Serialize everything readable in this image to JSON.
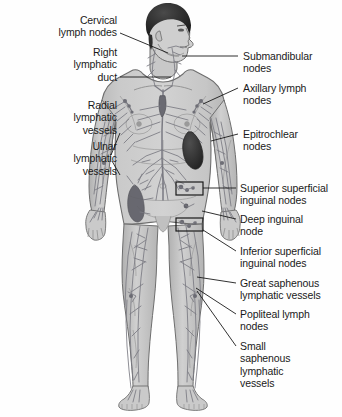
{
  "diagram": {
    "colors": {
      "body_fill": "#c9c9c9",
      "body_outline": "#6e6e6e",
      "vessel": "#7a7a82",
      "hair": "#2b2b2b",
      "spleen": "#3a3a3a",
      "leader_line": "#1a1a1a",
      "text": "#1a1a1a",
      "background": "#fefefe"
    }
  },
  "labels_left": [
    {
      "id": "cervical-lymph-nodes",
      "text": "Cervical\nlymph nodes",
      "x": 8,
      "y": 14,
      "width": 109,
      "leader": {
        "x1": 120,
        "y1": 33,
        "x2": 168,
        "y2": 53
      }
    },
    {
      "id": "right-lymphatic-duct",
      "text": "Right\nlymphatic\nduct",
      "x": 8,
      "y": 46,
      "width": 109,
      "leader": {
        "x1": 120,
        "y1": 77,
        "x2": 171,
        "y2": 77
      }
    },
    {
      "id": "radial-lymphatic-vessels",
      "text": "Radial\nlymphatic\nvessels",
      "x": 8,
      "y": 99,
      "width": 109,
      "leader": {
        "x1": 120,
        "y1": 133,
        "x2": 111,
        "y2": 155
      }
    },
    {
      "id": "ulnar-lymphatic-vessels",
      "text": "Ulnar\nlymphatic\nvessels",
      "x": 8,
      "y": 140,
      "width": 109,
      "leader": {
        "x1": 120,
        "y1": 175,
        "x2": 112,
        "y2": 161
      }
    }
  ],
  "labels_right": [
    {
      "id": "submandibular-nodes",
      "text": "Submandibular\nnodes",
      "x": 243,
      "y": 50,
      "width": 98,
      "leader": {
        "x1": 238,
        "y1": 56,
        "x2": 182,
        "y2": 56
      }
    },
    {
      "id": "axillary-lymph-nodes",
      "text": "Axillary lymph\nnodes",
      "x": 243,
      "y": 82,
      "width": 98,
      "leader": {
        "x1": 238,
        "y1": 88,
        "x2": 203,
        "y2": 104
      }
    },
    {
      "id": "epitrochlear-nodes",
      "text": "Epitrochlear\nnodes",
      "x": 243,
      "y": 128,
      "width": 98,
      "leader": {
        "x1": 238,
        "y1": 134,
        "x2": 211,
        "y2": 141
      }
    },
    {
      "id": "superior-superficial-inguinal-nodes",
      "text": "Superior superficial\ninguinal nodes",
      "x": 240,
      "y": 182,
      "width": 101,
      "leader": {
        "x1": 236,
        "y1": 188,
        "x2": 203,
        "y2": 188
      }
    },
    {
      "id": "deep-inguinal-node",
      "text": "Deep inguinal\nnode",
      "x": 240,
      "y": 213,
      "width": 101,
      "leader": {
        "x1": 236,
        "y1": 219,
        "x2": 202,
        "y2": 211
      }
    },
    {
      "id": "inferior-superficial-inguinal-nodes",
      "text": "Inferior superficial\ninguinal nodes",
      "x": 240,
      "y": 245,
      "width": 101,
      "leader": {
        "x1": 236,
        "y1": 251,
        "x2": 203,
        "y2": 230
      }
    },
    {
      "id": "great-saphenous-lymphatic-vessels",
      "text": "Great saphenous\nlymphatic vessels",
      "x": 240,
      "y": 277,
      "width": 101,
      "leader": {
        "x1": 236,
        "y1": 283,
        "x2": 197,
        "y2": 277
      }
    },
    {
      "id": "popliteal-lymph-nodes",
      "text": "Popliteal lymph\nnodes",
      "x": 240,
      "y": 308,
      "width": 101,
      "leader": {
        "x1": 236,
        "y1": 314,
        "x2": 196,
        "y2": 288
      }
    },
    {
      "id": "small-saphenous-lymphatic-vessels",
      "text": "Small\nsaphenous\nlymphatic\nvessels",
      "x": 240,
      "y": 340,
      "width": 101,
      "leader": {
        "x1": 236,
        "y1": 346,
        "x2": 197,
        "y2": 291
      }
    }
  ],
  "markers": [
    {
      "id": "superior-inguinal-bracket",
      "x": 176,
      "y": 182,
      "width": 27,
      "height": 13
    },
    {
      "id": "inferior-inguinal-bracket",
      "x": 176,
      "y": 218,
      "width": 27,
      "height": 13
    }
  ]
}
